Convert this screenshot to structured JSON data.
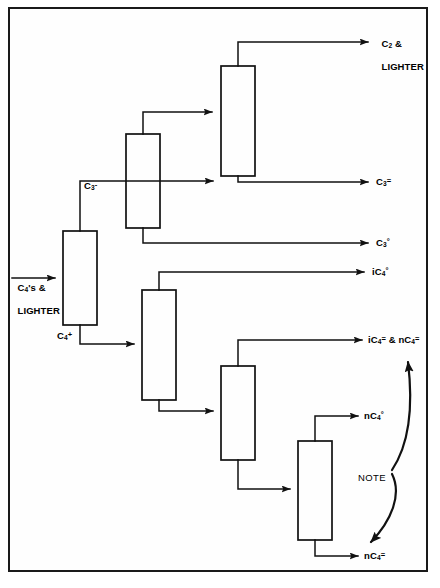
{
  "diagram": {
    "frame": {
      "stroke": "#1a1a1a",
      "fill": "#fefefe"
    },
    "line_color": "#111111",
    "columns": [
      {
        "id": "col1",
        "name": "deethanizer-feed-column",
        "x": 63,
        "y": 231,
        "w": 34,
        "h": 94
      },
      {
        "id": "col2",
        "name": "depropanizer-column",
        "x": 126,
        "y": 134,
        "w": 34,
        "h": 94
      },
      {
        "id": "col3",
        "name": "deethanizer-column",
        "x": 221,
        "y": 66,
        "w": 34,
        "h": 110
      },
      {
        "id": "col4",
        "name": "deisobutanizer-column",
        "x": 142,
        "y": 290,
        "w": 34,
        "h": 110
      },
      {
        "id": "col5",
        "name": "butylene-splitter-column",
        "x": 221,
        "y": 366,
        "w": 34,
        "h": 94
      },
      {
        "id": "col6",
        "name": "n-butane-splitter-column",
        "x": 298,
        "y": 441,
        "w": 34,
        "h": 99
      }
    ],
    "labels": {
      "feed": {
        "line1": "C4's &",
        "line2": "LIGHTER",
        "x": 12,
        "y": 273
      },
      "c3_minus": {
        "text": "C3-",
        "x": 84,
        "y": 180
      },
      "c4_plus": {
        "text": "C4+",
        "x": 57,
        "y": 330
      },
      "c2_and_lighter": {
        "line1": "C2 &",
        "line2": "LIGHTER",
        "x": 376,
        "y": 28
      },
      "c3_olefin": {
        "text": "C3=",
        "x": 376,
        "y": 177
      },
      "c3_paraffin": {
        "text": "C3°",
        "x": 376,
        "y": 238
      },
      "ic4_paraffin": {
        "text": "iC4°",
        "x": 372,
        "y": 267
      },
      "ic4_nc4_olefin": {
        "text": "iC4= & nC4=",
        "x": 368,
        "y": 334
      },
      "nc4_paraffin": {
        "text": "nC4°",
        "x": 364,
        "y": 410
      },
      "nc4_olefin": {
        "text": "nC4=",
        "x": 364,
        "y": 550
      },
      "note": {
        "text": "NOTE",
        "x": 358,
        "y": 472
      }
    },
    "streams": [
      {
        "name": "feed-to-col1",
        "from": "feed",
        "to": "col1",
        "label": "C4's & LIGHTER"
      },
      {
        "name": "col1-overhead",
        "from": "col1",
        "to": "col2",
        "label": "C3-"
      },
      {
        "name": "col1-bottoms",
        "from": "col1",
        "to": "col4",
        "label": "C4+"
      },
      {
        "name": "col2-overhead",
        "from": "col2",
        "to": "col3",
        "label": ""
      },
      {
        "name": "col2-bottoms",
        "from": "col2",
        "to": "product",
        "label": "C3°"
      },
      {
        "name": "col3-overhead",
        "from": "col3",
        "to": "product",
        "label": "C2 & LIGHTER"
      },
      {
        "name": "col3-bottoms",
        "from": "col3",
        "to": "product",
        "label": "C3="
      },
      {
        "name": "col4-overhead",
        "from": "col4",
        "to": "product",
        "label": "iC4°"
      },
      {
        "name": "col4-bottoms",
        "from": "col4",
        "to": "col5",
        "label": ""
      },
      {
        "name": "col5-overhead",
        "from": "col5",
        "to": "product",
        "label": "iC4= & nC4="
      },
      {
        "name": "col5-bottoms",
        "from": "col5",
        "to": "col6",
        "label": ""
      },
      {
        "name": "col6-overhead",
        "from": "col6",
        "to": "product",
        "label": "nC4°"
      },
      {
        "name": "col6-bottoms",
        "from": "col6",
        "to": "product",
        "label": "nC4="
      }
    ]
  }
}
